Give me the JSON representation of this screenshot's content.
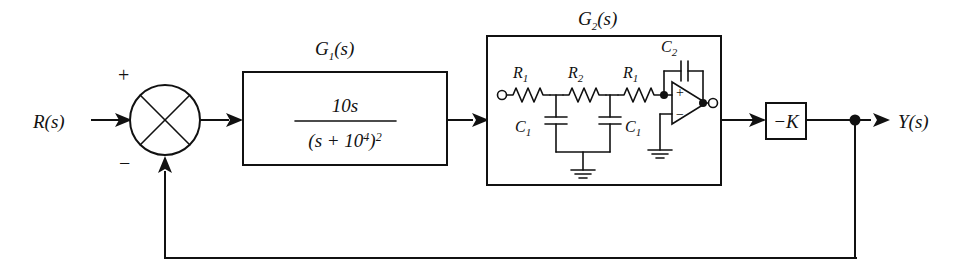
{
  "diagram": {
    "type": "block-diagram",
    "background_color": "#ffffff",
    "line_color": "#111111"
  },
  "signals": {
    "input_label": "R(s)",
    "output_label": "Y(s)"
  },
  "summing_junction": {
    "name": "summing-junction",
    "plus_sign": "+",
    "minus_sign": "−",
    "plus_position": "top-left",
    "minus_position": "bottom-left"
  },
  "blocks": {
    "g1": {
      "label": "G",
      "label_sub": "1",
      "label_suffix": "(s)",
      "transfer_function": {
        "numerator": "10s",
        "denominator_base": "(s + 10",
        "denominator_exp": "4",
        "denominator_close": ")",
        "denominator_power": "2"
      }
    },
    "g2": {
      "label": "G",
      "label_sub": "2",
      "label_suffix": "(s)",
      "components": {
        "r1a": {
          "label": "R",
          "sub": "1"
        },
        "r2": {
          "label": "R",
          "sub": "2"
        },
        "r1b": {
          "label": "R",
          "sub": "1"
        },
        "c1a": {
          "label": "C",
          "sub": "1"
        },
        "c1b": {
          "label": "C",
          "sub": "1"
        },
        "c2": {
          "label": "C",
          "sub": "2"
        }
      },
      "opamp": {
        "plus_input": "+",
        "minus_input": "−",
        "noninverting_input": "top",
        "inverting_input_to_ground": true
      },
      "ground_count": 2
    },
    "gain": {
      "label": "−K"
    }
  },
  "feedback": {
    "path": "from output tap back to summing junction negative input",
    "tap_label": "",
    "direction": "right-to-left"
  }
}
